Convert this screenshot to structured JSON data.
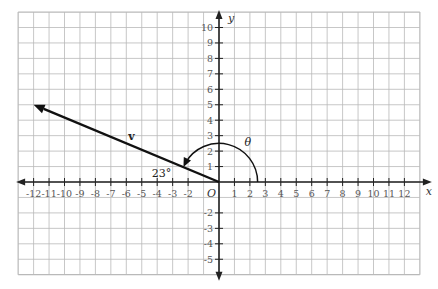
{
  "diagram": {
    "type": "coordinate-plane",
    "x_axis": {
      "label": "x",
      "min": -12,
      "max": 12,
      "grid_min": -13,
      "grid_max": 13
    },
    "y_axis": {
      "label": "y",
      "min": -5,
      "max": 10,
      "grid_min": -6,
      "grid_max": 11
    },
    "origin_label": "O",
    "x_ticks": [
      "-12",
      "-11",
      "-10",
      "-9",
      "-8",
      "-7",
      "-6",
      "-5",
      "-4",
      "-3",
      "-2",
      "1",
      "2",
      "3",
      "4",
      "5",
      "6",
      "7",
      "8",
      "9",
      "10",
      "11",
      "12"
    ],
    "x_tick_values": [
      -12,
      -11,
      -10,
      -9,
      -8,
      -7,
      -6,
      -5,
      -4,
      -3,
      -2,
      1,
      2,
      3,
      4,
      5,
      6,
      7,
      8,
      9,
      10,
      11,
      12
    ],
    "y_ticks": [
      "10",
      "9",
      "8",
      "7",
      "6",
      "5",
      "4",
      "3",
      "2",
      "1",
      "-2",
      "-3",
      "-4",
      "-5"
    ],
    "y_tick_values": [
      10,
      9,
      8,
      7,
      6,
      5,
      4,
      3,
      2,
      1,
      -2,
      -3,
      -4,
      -5
    ],
    "vector": {
      "label": "v",
      "from": [
        0,
        0
      ],
      "to": [
        -12,
        5
      ]
    },
    "angle_theta": {
      "label": "θ",
      "radius": 2.5,
      "from_deg": 0,
      "to_deg": 157
    },
    "reference_angle": {
      "label": "23°",
      "position": [
        -4,
        1
      ]
    },
    "colors": {
      "grid": "#b9b9b9",
      "axis": "#222222",
      "vector": "#111111"
    }
  }
}
